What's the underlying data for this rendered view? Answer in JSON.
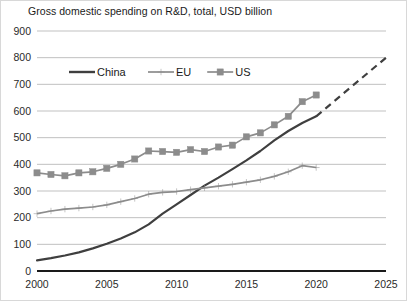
{
  "chart_data": {
    "type": "line",
    "title": "Gross domestic spending on R&D, total, USD billion",
    "xlabel": "",
    "ylabel": "",
    "xlim": [
      2000,
      2025
    ],
    "ylim": [
      0,
      900
    ],
    "yticks": [
      0,
      100,
      200,
      300,
      400,
      500,
      600,
      700,
      800,
      900
    ],
    "xticks": [
      2000,
      2005,
      2010,
      2015,
      2020,
      2025
    ],
    "grid": true,
    "legend_position": "top-left-inside",
    "x": [
      2000,
      2001,
      2002,
      2003,
      2004,
      2005,
      2006,
      2007,
      2008,
      2009,
      2010,
      2011,
      2012,
      2013,
      2014,
      2015,
      2016,
      2017,
      2018,
      2019,
      2020
    ],
    "series": [
      {
        "name": "China",
        "color": "#3f3f3f",
        "marker": "none",
        "style": "solid",
        "values": [
          40,
          48,
          58,
          70,
          85,
          102,
          122,
          145,
          175,
          215,
          250,
          285,
          320,
          350,
          382,
          415,
          450,
          490,
          525,
          555,
          580
        ]
      },
      {
        "name": "EU",
        "color": "#8c8c8c",
        "marker": "plus",
        "style": "solid",
        "values": [
          215,
          225,
          232,
          236,
          240,
          248,
          260,
          272,
          288,
          295,
          298,
          305,
          312,
          318,
          325,
          333,
          342,
          355,
          372,
          395,
          388
        ]
      },
      {
        "name": "US",
        "color": "#8c8c8c",
        "marker": "square",
        "style": "solid",
        "values": [
          368,
          362,
          357,
          368,
          372,
          385,
          400,
          420,
          450,
          448,
          445,
          455,
          448,
          465,
          472,
          503,
          518,
          548,
          580,
          635,
          660
        ]
      }
    ],
    "projection": {
      "name": "China projection",
      "series": "China",
      "style": "dashed",
      "color": "#3f3f3f",
      "x": [
        2020,
        2025
      ],
      "values": [
        580,
        800
      ]
    },
    "legend": [
      {
        "label": "China",
        "marker": "none",
        "color": "#3f3f3f"
      },
      {
        "label": "EU",
        "marker": "plus",
        "color": "#8c8c8c"
      },
      {
        "label": "US",
        "marker": "square",
        "color": "#8c8c8c"
      }
    ]
  }
}
